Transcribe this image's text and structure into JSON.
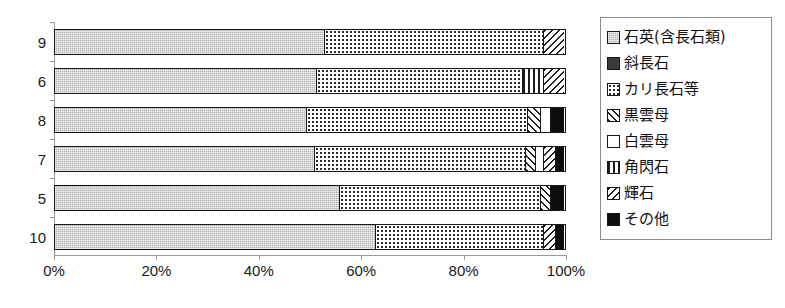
{
  "chart_data": {
    "type": "bar",
    "orientation": "horizontal",
    "stacked": true,
    "normalized": "100%",
    "title": "",
    "xlabel": "",
    "ylabel": "",
    "xlim": [
      0,
      100
    ],
    "grid": false,
    "legend_position": "right",
    "xticks": [
      "0%",
      "20%",
      "40%",
      "60%",
      "80%",
      "100%"
    ],
    "xtick_values": [
      0,
      20,
      40,
      60,
      80,
      100
    ],
    "categories": [
      "9",
      "6",
      "8",
      "7",
      "5",
      "10"
    ],
    "series": [
      {
        "name": "石英(含長石類)",
        "pattern": "solid-gray",
        "values": [
          53.0,
          51.5,
          49.5,
          51.0,
          56.0,
          63.0
        ]
      },
      {
        "name": "斜長石",
        "pattern": "solid-dark",
        "values": [
          0.0,
          0.0,
          0.0,
          0.0,
          0.0,
          0.0
        ]
      },
      {
        "name": "カリ長石等",
        "pattern": "dotted",
        "values": [
          43.0,
          40.5,
          43.5,
          41.5,
          39.5,
          33.0
        ]
      },
      {
        "name": "黒雲母",
        "pattern": "diagonal-up",
        "values": [
          0.0,
          0.0,
          2.5,
          2.0,
          2.0,
          0.0
        ]
      },
      {
        "name": "白雲母",
        "pattern": "white",
        "values": [
          0.0,
          0.0,
          2.0,
          1.5,
          0.0,
          0.0
        ]
      },
      {
        "name": "角閃石",
        "pattern": "vertical-lines",
        "values": [
          0.0,
          4.0,
          0.0,
          0.0,
          0.0,
          0.0
        ]
      },
      {
        "name": "輝石",
        "pattern": "diagonal-down",
        "values": [
          4.0,
          4.0,
          0.0,
          2.5,
          0.0,
          2.5
        ]
      },
      {
        "name": "その他",
        "pattern": "solid-black",
        "values": [
          0.0,
          0.0,
          2.5,
          1.5,
          2.5,
          1.5
        ]
      }
    ]
  },
  "legend": {
    "items": [
      {
        "label": "石英(含長石類)"
      },
      {
        "label": "斜長石"
      },
      {
        "label": "カリ長石等"
      },
      {
        "label": "黒雲母"
      },
      {
        "label": "白雲母"
      },
      {
        "label": "角閃石"
      },
      {
        "label": "輝石"
      },
      {
        "label": "その他"
      }
    ]
  }
}
